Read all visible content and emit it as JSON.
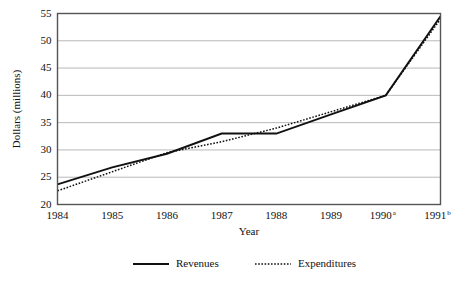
{
  "chart_data": {
    "type": "line",
    "title": "",
    "xlabel": "Year",
    "ylabel": "Dollars (millions)",
    "categories": [
      "1984",
      "1985",
      "1986",
      "1987",
      "1988",
      "1989",
      "1990",
      "1991"
    ],
    "category_superscripts": [
      "",
      "",
      "",
      "",
      "",
      "",
      "a",
      "b"
    ],
    "xtick_labels": [
      "1984",
      "1985",
      "1986",
      "1987",
      "1988",
      "1989",
      "1990",
      "1991"
    ],
    "ytick_labels": [
      "20",
      "25",
      "30",
      "35",
      "40",
      "45",
      "50",
      "55"
    ],
    "ytick_values": [
      20,
      25,
      30,
      35,
      40,
      45,
      50,
      55
    ],
    "ylim": [
      20,
      55
    ],
    "grid": "horizontal",
    "legend_position": "bottom-center",
    "series": [
      {
        "name": "Revenues",
        "style": "solid",
        "color": "#111111",
        "values": [
          23.7,
          26.8,
          29.3,
          33.0,
          33.0,
          36.5,
          40.0,
          54.5
        ]
      },
      {
        "name": "Expenditures",
        "style": "dotted",
        "color": "#111111",
        "values": [
          22.5,
          26.0,
          29.5,
          31.5,
          34.0,
          37.0,
          40.0,
          54.0
        ]
      }
    ]
  },
  "colors": {
    "gridline": "#b9b9b9",
    "frame": "#555555",
    "text": "#111111",
    "background": "#ffffff"
  },
  "legend": {
    "items": [
      {
        "label": "Revenues",
        "style": "solid"
      },
      {
        "label": "Expenditures",
        "style": "dotted"
      }
    ]
  }
}
